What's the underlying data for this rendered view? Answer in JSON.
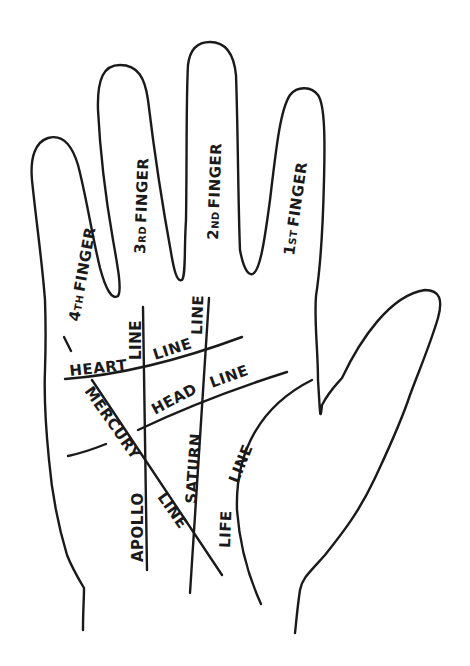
{
  "diagram": {
    "colors": {
      "ink": "#1a1a1a",
      "background": "#ffffff"
    },
    "fingers": [
      {
        "id": "fourth",
        "num": "4",
        "suffix": "TH",
        "word": "FINGER"
      },
      {
        "id": "third",
        "num": "3",
        "suffix": "RD",
        "word": "FINGER"
      },
      {
        "id": "second",
        "num": "2",
        "suffix": "ND",
        "word": "FINGER"
      },
      {
        "id": "first",
        "num": "1",
        "suffix": "ST",
        "word": "FINGER"
      }
    ],
    "lines": {
      "heart": {
        "part1": "HEART",
        "part2": "LINE"
      },
      "head": {
        "part1": "HEAD",
        "part2": "LINE"
      },
      "mercury": {
        "part1": "MERCURY",
        "part2": "LINE"
      },
      "apollo": {
        "part1": "APOLLO",
        "part2": "LINE"
      },
      "saturn": {
        "part1": "SATURN",
        "part2": "LINE"
      },
      "life": {
        "part1": "LIFE",
        "part2": "LINE"
      }
    }
  }
}
